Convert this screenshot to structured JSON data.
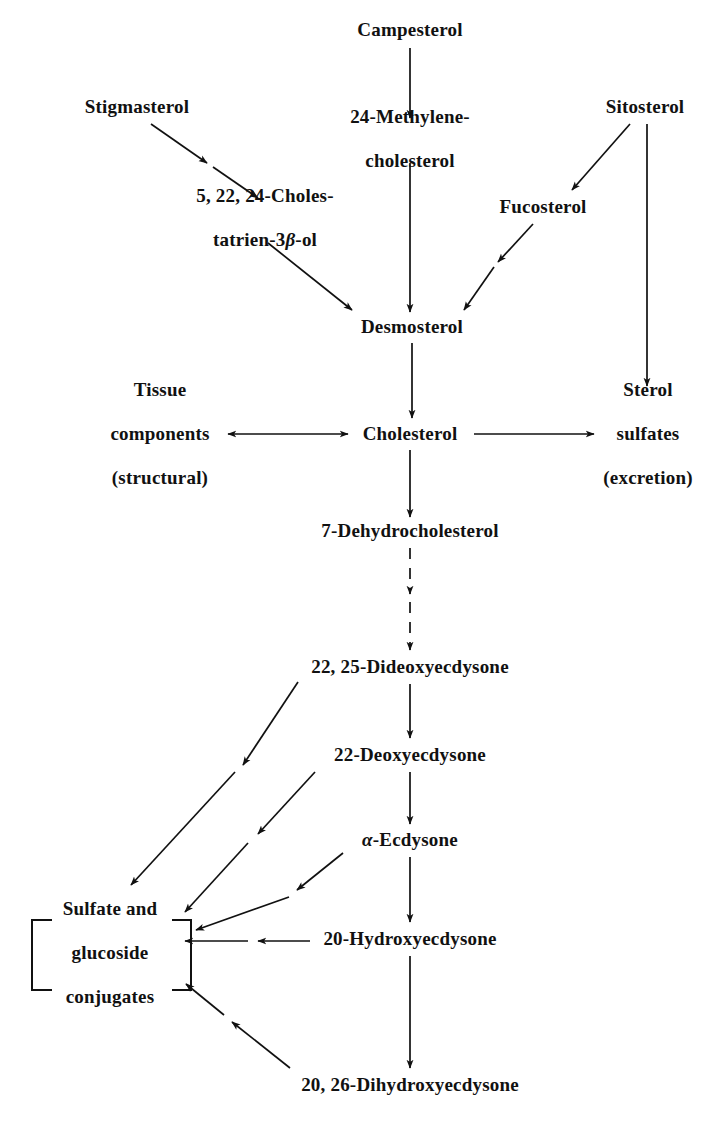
{
  "diagram": {
    "type": "flowchart",
    "ink_color": "#111111",
    "background_color": "#ffffff"
  },
  "nodes": [
    {
      "id": "campesterol",
      "label": "Campesterol",
      "lines": [
        "Campesterol"
      ],
      "x": 410,
      "y": 30
    },
    {
      "id": "stigmasterol",
      "label": "Stigmasterol",
      "lines": [
        "Stigmasterol"
      ],
      "x": 137,
      "y": 107
    },
    {
      "id": "methylene",
      "label": "24-Methylene-cholesterol",
      "lines": [
        "24-Methylene-",
        "cholesterol"
      ],
      "x": 410,
      "y": 139
    },
    {
      "id": "sitosterol",
      "label": "Sitosterol",
      "lines": [
        "Sitosterol"
      ],
      "x": 645,
      "y": 107
    },
    {
      "id": "cholestatrienol",
      "label": "5, 22, 24-Cholestatrien-3β-ol",
      "lines": [
        "5, 22, 24-Choles-",
        "tatrien-3β-ol"
      ],
      "x": 265,
      "y": 218
    },
    {
      "id": "fucosterol",
      "label": "Fucosterol",
      "lines": [
        "Fucosterol"
      ],
      "x": 543,
      "y": 207
    },
    {
      "id": "desmosterol",
      "label": "Desmosterol",
      "lines": [
        "Desmosterol"
      ],
      "x": 412,
      "y": 327
    },
    {
      "id": "tissue",
      "label": "Tissue components (structural)",
      "lines": [
        "Tissue",
        "components",
        "(structural)"
      ],
      "x": 160,
      "y": 434
    },
    {
      "id": "cholesterol",
      "label": "Cholesterol",
      "lines": [
        "Cholesterol"
      ],
      "x": 410,
      "y": 434
    },
    {
      "id": "sterolsulfates",
      "label": "Sterol sulfates (excretion)",
      "lines": [
        "Sterol",
        "sulfates",
        "(excretion)"
      ],
      "x": 648,
      "y": 434
    },
    {
      "id": "dehydrochol",
      "label": "7-Dehydrocholesterol",
      "lines": [
        "7-Dehydrocholesterol"
      ],
      "x": 410,
      "y": 531
    },
    {
      "id": "dideoxyecdysone",
      "label": "22, 25-Dideoxyecdysone",
      "lines": [
        "22, 25-Dideoxyecdysone"
      ],
      "x": 410,
      "y": 667
    },
    {
      "id": "deoxyecdysone",
      "label": "22-Deoxyecdysone",
      "lines": [
        "22-Deoxyecdysone"
      ],
      "x": 410,
      "y": 755
    },
    {
      "id": "alphaecdysone",
      "label": "α-Ecdysone",
      "lines": [
        "α-Ecdysone"
      ],
      "x": 410,
      "y": 840
    },
    {
      "id": "conjugates",
      "label": "Sulfate and glucoside conjugates",
      "lines": [
        "Sulfate and",
        "glucoside",
        "conjugates"
      ],
      "x": 110,
      "y": 953
    },
    {
      "id": "hydroxyecdysone",
      "label": "20-Hydroxyecdysone",
      "lines": [
        "20-Hydroxyecdysone"
      ],
      "x": 410,
      "y": 939
    },
    {
      "id": "dihydroxyecdysone",
      "label": "20, 26-Dihydroxyecdysone",
      "lines": [
        "20, 26-Dihydroxyecdysone"
      ],
      "x": 410,
      "y": 1085
    }
  ],
  "edges": [
    {
      "id": "e-campesterol-methylene",
      "from": "Campesterol",
      "to": "24-Methylene-cholesterol",
      "style": "solid",
      "heads": 1,
      "direction": "down"
    },
    {
      "id": "e-stigmasterol-cholestatrien",
      "from": "Stigmasterol",
      "to": "5, 22, 24-Cholestatrien-3β-ol",
      "style": "solid",
      "heads": 2,
      "direction": "down-left-diagonal"
    },
    {
      "id": "e-sitosterol-fucosterol",
      "from": "Sitosterol",
      "to": "Fucosterol",
      "style": "solid",
      "heads": 1,
      "direction": "down-left-diagonal"
    },
    {
      "id": "e-sitosterol-sulfates",
      "from": "Sitosterol",
      "to": "Sterol sulfates (excretion)",
      "style": "solid",
      "heads": 1,
      "direction": "down"
    },
    {
      "id": "e-methylene-desmosterol",
      "from": "24-Methylene-cholesterol",
      "to": "Desmosterol",
      "style": "solid",
      "heads": 1,
      "direction": "down"
    },
    {
      "id": "e-cholestatrien-desmosterol",
      "from": "5, 22, 24-Cholestatrien-3β-ol",
      "to": "Desmosterol",
      "style": "solid",
      "heads": 1,
      "direction": "down-right-diagonal"
    },
    {
      "id": "e-fucosterol-desmosterol",
      "from": "Fucosterol",
      "to": "Desmosterol",
      "style": "solid",
      "heads": 2,
      "direction": "down-left-diagonal"
    },
    {
      "id": "e-desmosterol-cholesterol",
      "from": "Desmosterol",
      "to": "Cholesterol",
      "style": "solid",
      "heads": 1,
      "direction": "down"
    },
    {
      "id": "e-cholesterol-tissue",
      "from": "Cholesterol",
      "to": "Tissue components (structural)",
      "style": "solid",
      "heads": 2,
      "direction": "bidirectional-left"
    },
    {
      "id": "e-cholesterol-sulfates",
      "from": "Cholesterol",
      "to": "Sterol sulfates (excretion)",
      "style": "solid",
      "heads": 1,
      "direction": "right"
    },
    {
      "id": "e-cholesterol-dehydrochol",
      "from": "Cholesterol",
      "to": "7-Dehydrocholesterol",
      "style": "solid",
      "heads": 1,
      "direction": "down"
    },
    {
      "id": "e-dehydrochol-dideoxy",
      "from": "7-Dehydrocholesterol",
      "to": "22, 25-Dideoxyecdysone",
      "style": "dashed",
      "heads": 2,
      "direction": "down"
    },
    {
      "id": "e-dideoxy-deoxy",
      "from": "22, 25-Dideoxyecdysone",
      "to": "22-Deoxyecdysone",
      "style": "solid",
      "heads": 1,
      "direction": "down"
    },
    {
      "id": "e-dideoxy-conjugates",
      "from": "22, 25-Dideoxyecdysone",
      "to": "Sulfate and glucoside conjugates",
      "style": "solid",
      "heads": 2,
      "direction": "down-left-diagonal"
    },
    {
      "id": "e-deoxy-alpha",
      "from": "22-Deoxyecdysone",
      "to": "α-Ecdysone",
      "style": "solid",
      "heads": 1,
      "direction": "down"
    },
    {
      "id": "e-deoxy-conjugates",
      "from": "22-Deoxyecdysone",
      "to": "Sulfate and glucoside conjugates",
      "style": "solid",
      "heads": 2,
      "direction": "down-left-diagonal"
    },
    {
      "id": "e-alpha-hydroxy",
      "from": "α-Ecdysone",
      "to": "20-Hydroxyecdysone",
      "style": "solid",
      "heads": 1,
      "direction": "down"
    },
    {
      "id": "e-alpha-conjugates",
      "from": "α-Ecdysone",
      "to": "Sulfate and glucoside conjugates",
      "style": "solid",
      "heads": 2,
      "direction": "down-left-diagonal"
    },
    {
      "id": "e-hydroxy-conjugates",
      "from": "20-Hydroxyecdysone",
      "to": "Sulfate and glucoside conjugates",
      "style": "solid",
      "heads": 2,
      "direction": "left"
    },
    {
      "id": "e-hydroxy-dihydroxy",
      "from": "20-Hydroxyecdysone",
      "to": "20, 26-Dihydroxyecdysone",
      "style": "solid",
      "heads": 1,
      "direction": "down"
    },
    {
      "id": "e-dihydroxy-conjugates",
      "from": "20, 26-Dihydroxyecdysone",
      "to": "Sulfate and glucoside conjugates",
      "style": "solid",
      "heads": 2,
      "direction": "up-left-diagonal"
    }
  ],
  "bracket": {
    "label": "square-bracket-pair",
    "encloses": "Sulfate and glucoside conjugates"
  }
}
